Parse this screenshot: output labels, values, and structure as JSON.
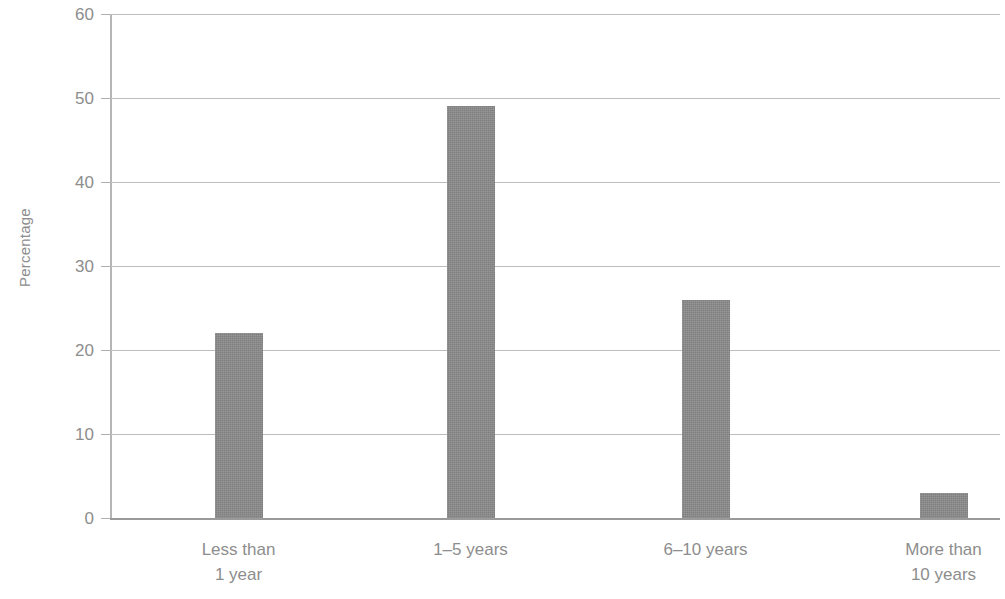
{
  "chart_data": {
    "type": "bar",
    "title": "",
    "subtitle": "",
    "xlabel": "",
    "ylabel": "Percentage",
    "categories": [
      "Less than 1 year",
      "1–5 years",
      "6–10 years",
      "More than 10 years"
    ],
    "category_lines": [
      [
        "Less than",
        "1 year"
      ],
      [
        "1–5 years",
        ""
      ],
      [
        "6–10 years",
        ""
      ],
      [
        "More than",
        "10 years"
      ]
    ],
    "values": [
      22,
      49,
      26,
      3
    ],
    "ylim": [
      0,
      60
    ],
    "ytick_values": [
      0,
      10,
      20,
      30,
      40,
      50,
      60
    ],
    "ytick_labels": [
      "0",
      "10",
      "20",
      "30",
      "40",
      "50",
      "60"
    ],
    "ytick_interval": 10,
    "grid": true,
    "grid_axis": "y",
    "legend": "none",
    "bar_color": "#8a8a8a",
    "grid_color": "#bdbdbd",
    "axis_color": "#b5b5b5",
    "text_color": "#8d8d8d",
    "background_color": "#ffffff",
    "annotations": []
  }
}
